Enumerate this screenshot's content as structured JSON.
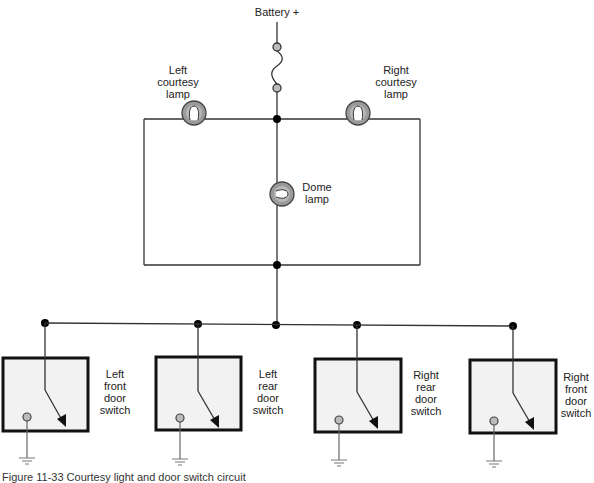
{
  "diagram": {
    "title_top": "Battery +",
    "caption": "Figure 11-33 Courtesy light and door switch circuit",
    "colors": {
      "wire": "#333333",
      "junction": "#000000",
      "lamp_fill": "#9a9a9a",
      "switch_fill": "#f2f2f2",
      "switch_border": "#111111",
      "terminal_fill": "#bbbbbb",
      "ground": "#666666"
    },
    "components": {
      "fuse": {
        "label": "fuse"
      },
      "left_courtesy_lamp": {
        "lines": [
          "Left",
          "courtesy",
          "lamp"
        ]
      },
      "right_courtesy_lamp": {
        "lines": [
          "Right",
          "courtesy",
          "lamp"
        ]
      },
      "dome_lamp": {
        "lines": [
          "Dome",
          "lamp"
        ]
      },
      "switches": [
        {
          "lines": [
            "Left",
            "front",
            "door",
            "switch"
          ]
        },
        {
          "lines": [
            "Left",
            "rear",
            "door",
            "switch"
          ]
        },
        {
          "lines": [
            "Right",
            "rear",
            "door",
            "switch"
          ]
        },
        {
          "lines": [
            "Right",
            "front",
            "door",
            "switch"
          ]
        }
      ]
    }
  }
}
